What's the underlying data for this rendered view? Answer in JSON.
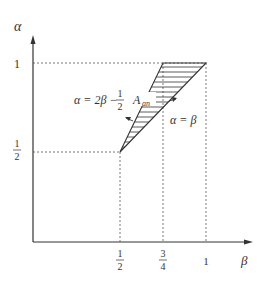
{
  "diagram": {
    "axes": {
      "y_label": "α",
      "x_label": "β"
    },
    "y_ticks": [
      {
        "label": "1",
        "value": 1
      },
      {
        "label_num": "1",
        "label_den": "2",
        "value": 0.5
      }
    ],
    "x_ticks": [
      {
        "label_num": "1",
        "label_den": "2",
        "value": 0.5
      },
      {
        "label_num": "3",
        "label_den": "4",
        "value": 0.75
      },
      {
        "label": "1",
        "value": 1
      }
    ],
    "lines": {
      "upper_label_prefix": "α = 2β −",
      "upper_frac_num": "1",
      "upper_frac_den": "2",
      "lower_label": "α = β"
    },
    "region": {
      "label_main": "A",
      "label_sub": "an",
      "vertices": [
        [
          0.5,
          0.5
        ],
        [
          0.75,
          1
        ],
        [
          1,
          1
        ]
      ],
      "fill": "horizontal hatching"
    },
    "colors": {
      "ink": "#333333",
      "guide": "#555555"
    }
  }
}
